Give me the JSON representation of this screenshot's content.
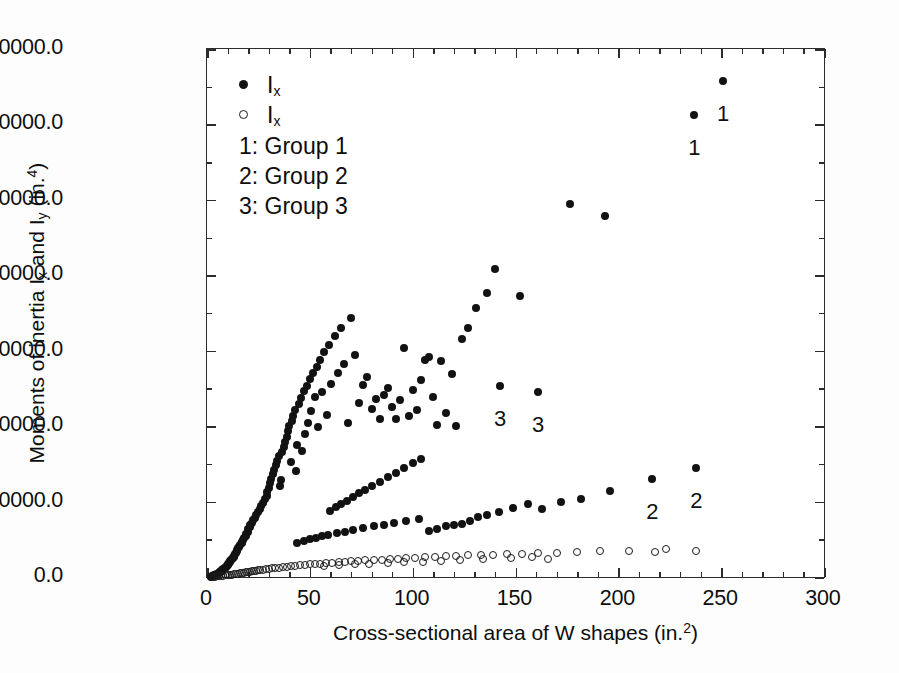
{
  "figure": {
    "background": "#ffffff",
    "foreground": "#121212"
  },
  "axes": {
    "y_title_prefix": "Moments of inertia I",
    "y_title_sub1": "x",
    "y_title_mid": " and I",
    "y_title_sub2": "y",
    "y_title_suffix": " (in.",
    "y_title_sup": "4",
    "y_title_close": ")",
    "x_title_prefix": "Cross-sectional area of W shapes (in.",
    "x_title_sup": "2",
    "x_title_close": ")"
  },
  "legend": {
    "entries": [
      {
        "marker": "filled-circle",
        "symbol": "I",
        "subscript": "x"
      },
      {
        "marker": "open-circle",
        "symbol": "I",
        "subscript": "x"
      }
    ],
    "groups": [
      "1: Group 1",
      "2: Group 2",
      "3: Group 3"
    ]
  },
  "chart_data": {
    "type": "scatter",
    "title": "",
    "xlabel": "Cross-sectional area of W shapes (in.^2)",
    "ylabel": "Moments of inertia I_x and I_y (in.^4)",
    "xlim": [
      0,
      300
    ],
    "ylim": [
      0,
      70000
    ],
    "xticks": [
      0,
      50,
      100,
      150,
      200,
      250,
      300
    ],
    "xticklabels": [
      "0",
      "50",
      "100",
      "150",
      "200",
      "250",
      "300"
    ],
    "yticks": [
      0,
      10000,
      20000,
      30000,
      40000,
      50000,
      60000,
      70000
    ],
    "yticklabels": [
      "0.0",
      "10000.0",
      "20000.0",
      "30000.0",
      "40000.0",
      "50000.0",
      "60000.0",
      "70000.0"
    ],
    "xminor_step": 10,
    "yminor_step": 5000,
    "grid": false,
    "legend_position": "upper-left-inside-margin",
    "series": [
      {
        "name": "I_x",
        "marker": "filled-circle",
        "points": [
          [
            1.8,
            60
          ],
          [
            2.2,
            90
          ],
          [
            2.7,
            130
          ],
          [
            3.0,
            170
          ],
          [
            3.5,
            210
          ],
          [
            4.0,
            260
          ],
          [
            4.4,
            310
          ],
          [
            4.7,
            350
          ],
          [
            5.0,
            400
          ],
          [
            5.3,
            450
          ],
          [
            5.6,
            500
          ],
          [
            5.9,
            560
          ],
          [
            6.2,
            620
          ],
          [
            6.5,
            680
          ],
          [
            6.8,
            740
          ],
          [
            7.1,
            800
          ],
          [
            7.4,
            880
          ],
          [
            7.7,
            950
          ],
          [
            8.0,
            1020
          ],
          [
            8.5,
            1100
          ],
          [
            8.8,
            1200
          ],
          [
            9.1,
            1290
          ],
          [
            9.4,
            1380
          ],
          [
            9.7,
            1480
          ],
          [
            10.0,
            1600
          ],
          [
            10.3,
            1700
          ],
          [
            10.6,
            1830
          ],
          [
            11.0,
            1950
          ],
          [
            11.3,
            2070
          ],
          [
            11.8,
            2200
          ],
          [
            12.2,
            2370
          ],
          [
            12.6,
            2540
          ],
          [
            13.0,
            2700
          ],
          [
            13.3,
            2850
          ],
          [
            13.8,
            3000
          ],
          [
            14.1,
            3200
          ],
          [
            14.4,
            3400
          ],
          [
            14.7,
            3620
          ],
          [
            15.0,
            3800
          ],
          [
            15.6,
            4020
          ],
          [
            16.2,
            4280
          ],
          [
            16.8,
            4500
          ],
          [
            17.1,
            4700
          ],
          [
            17.6,
            4930
          ],
          [
            18.2,
            5200
          ],
          [
            18.8,
            5450
          ],
          [
            19.1,
            5700
          ],
          [
            19.7,
            6000
          ],
          [
            20.0,
            6300
          ],
          [
            20.8,
            6600
          ],
          [
            21.1,
            6900
          ],
          [
            21.8,
            7200
          ],
          [
            22.4,
            7500
          ],
          [
            23.2,
            7800
          ],
          [
            24.0,
            8200
          ],
          [
            24.7,
            8600
          ],
          [
            25.6,
            9000
          ],
          [
            26.2,
            9400
          ],
          [
            27.3,
            9800
          ],
          [
            28.2,
            10300
          ],
          [
            29.1,
            10800
          ],
          [
            29.4,
            11300
          ],
          [
            30.0,
            11800
          ],
          [
            30.6,
            12400
          ],
          [
            31.2,
            13000
          ],
          [
            32.0,
            13600
          ],
          [
            32.7,
            14200
          ],
          [
            33.5,
            14800
          ],
          [
            34.2,
            15400
          ],
          [
            35.0,
            16000
          ],
          [
            35.3,
            12100
          ],
          [
            36.0,
            12800
          ],
          [
            36.5,
            16600
          ],
          [
            37.2,
            17300
          ],
          [
            38.0,
            17900
          ],
          [
            38.8,
            18600
          ],
          [
            39.4,
            19300
          ],
          [
            40.0,
            20000
          ],
          [
            40.6,
            15200
          ],
          [
            41.2,
            20700
          ],
          [
            42.0,
            21400
          ],
          [
            42.7,
            22100
          ],
          [
            43.4,
            14000
          ],
          [
            44.0,
            17500
          ],
          [
            44.8,
            23000
          ],
          [
            45.5,
            23700
          ],
          [
            46.2,
            16700
          ],
          [
            47.0,
            24600
          ],
          [
            47.8,
            18900
          ],
          [
            48.5,
            25300
          ],
          [
            49.2,
            20400
          ],
          [
            50.0,
            26200
          ],
          [
            50.7,
            22000
          ],
          [
            51.5,
            27000
          ],
          [
            52.4,
            23800
          ],
          [
            53.3,
            27900
          ],
          [
            54.2,
            19900
          ],
          [
            55.0,
            28800
          ],
          [
            56.0,
            24500
          ],
          [
            57.0,
            29800
          ],
          [
            58.2,
            21500
          ],
          [
            59.4,
            30800
          ],
          [
            60.5,
            25600
          ],
          [
            62.0,
            31900
          ],
          [
            63.5,
            27000
          ],
          [
            65.0,
            33000
          ],
          [
            66.8,
            28200
          ],
          [
            68.5,
            20400
          ],
          [
            70.0,
            34300
          ],
          [
            72.0,
            29400
          ],
          [
            74.0,
            23100
          ],
          [
            76.0,
            25400
          ],
          [
            78.0,
            26500
          ],
          [
            80.0,
            22300
          ],
          [
            82.0,
            23600
          ],
          [
            84.0,
            21000
          ],
          [
            86.0,
            24100
          ],
          [
            88.0,
            25100
          ],
          [
            90.0,
            22600
          ],
          [
            92.0,
            20900
          ],
          [
            94.0,
            23400
          ],
          [
            96.0,
            30400
          ],
          [
            98.0,
            21400
          ],
          [
            100.0,
            24800
          ],
          [
            102.0,
            22200
          ],
          [
            104.0,
            26100
          ],
          [
            106.0,
            28800
          ],
          [
            108.0,
            29200
          ],
          [
            110.0,
            23900
          ],
          [
            112.0,
            20100
          ],
          [
            114.0,
            28600
          ],
          [
            116.0,
            21700
          ],
          [
            119.0,
            26900
          ],
          [
            121.0,
            20000
          ],
          [
            124.0,
            31500
          ],
          [
            127.0,
            33000
          ],
          [
            131.0,
            35600
          ],
          [
            136.0,
            37600
          ],
          [
            140.0,
            40800
          ],
          [
            152.0,
            37300
          ],
          [
            176.5,
            49400
          ],
          [
            193.5,
            47900
          ],
          [
            237.0,
            61200
          ],
          [
            251.0,
            65700
          ],
          [
            142.5,
            25300
          ],
          [
            161.0,
            24500
          ],
          [
            216.5,
            13000
          ],
          [
            238.0,
            14500
          ],
          [
            60.0,
            8800
          ],
          [
            62.5,
            9300
          ],
          [
            65.0,
            9700
          ],
          [
            68.0,
            10100
          ],
          [
            71.0,
            10600
          ],
          [
            74.0,
            11100
          ],
          [
            77.0,
            11600
          ],
          [
            80.0,
            12100
          ],
          [
            84.0,
            12600
          ],
          [
            88.0,
            13200
          ],
          [
            92.0,
            13800
          ],
          [
            96.0,
            14400
          ],
          [
            100.0,
            15100
          ],
          [
            104.0,
            15700
          ],
          [
            108.0,
            6100
          ],
          [
            112.0,
            6400
          ],
          [
            116.0,
            6700
          ],
          [
            120.0,
            6900
          ],
          [
            124.0,
            7000
          ],
          [
            128.0,
            7400
          ],
          [
            132.0,
            7900
          ],
          [
            136.0,
            8200
          ],
          [
            142.0,
            8600
          ],
          [
            149.0,
            9200
          ],
          [
            156.0,
            9700
          ],
          [
            163.0,
            9000
          ],
          [
            172.0,
            9900
          ],
          [
            182.0,
            10400
          ],
          [
            196.0,
            11400
          ],
          [
            44.0,
            4500
          ],
          [
            47.0,
            4800
          ],
          [
            50.0,
            5000
          ],
          [
            53.0,
            5200
          ],
          [
            56.0,
            5400
          ],
          [
            59.0,
            5600
          ],
          [
            63.0,
            5800
          ],
          [
            67.0,
            6000
          ],
          [
            71.0,
            6200
          ],
          [
            76.0,
            6500
          ],
          [
            81.0,
            6700
          ],
          [
            86.0,
            6900
          ],
          [
            91.0,
            7100
          ],
          [
            97.0,
            7400
          ],
          [
            103.0,
            7700
          ]
        ]
      },
      {
        "name": "I_y",
        "marker": "open-circle",
        "points": [
          [
            2.0,
            20
          ],
          [
            3.0,
            40
          ],
          [
            4.0,
            60
          ],
          [
            5.0,
            80
          ],
          [
            6.0,
            110
          ],
          [
            7.0,
            140
          ],
          [
            8.0,
            170
          ],
          [
            9.0,
            200
          ],
          [
            10.0,
            240
          ],
          [
            11.0,
            280
          ],
          [
            12.0,
            320
          ],
          [
            13.0,
            360
          ],
          [
            14.0,
            400
          ],
          [
            15.0,
            440
          ],
          [
            16.0,
            480
          ],
          [
            17.0,
            520
          ],
          [
            18.0,
            560
          ],
          [
            19.0,
            600
          ],
          [
            20.0,
            640
          ],
          [
            21.0,
            690
          ],
          [
            22.0,
            740
          ],
          [
            23.0,
            780
          ],
          [
            24.0,
            830
          ],
          [
            25.0,
            880
          ],
          [
            26.0,
            930
          ],
          [
            27.0,
            980
          ],
          [
            28.5,
            1030
          ],
          [
            30.0,
            1080
          ],
          [
            31.5,
            1130
          ],
          [
            33.0,
            1180
          ],
          [
            35.0,
            1240
          ],
          [
            37.0,
            1300
          ],
          [
            39.0,
            1360
          ],
          [
            41.0,
            1420
          ],
          [
            43.0,
            1480
          ],
          [
            45.0,
            1540
          ],
          [
            47.5,
            1600
          ],
          [
            50.0,
            1660
          ],
          [
            52.5,
            1720
          ],
          [
            55.0,
            1780
          ],
          [
            58.0,
            1840
          ],
          [
            61.0,
            1900
          ],
          [
            64.0,
            1960
          ],
          [
            67.0,
            2020
          ],
          [
            70.0,
            2080
          ],
          [
            73.5,
            2140
          ],
          [
            77.0,
            2200
          ],
          [
            81.0,
            2260
          ],
          [
            85.0,
            2320
          ],
          [
            89.0,
            2380
          ],
          [
            93.0,
            2440
          ],
          [
            97.0,
            2500
          ],
          [
            101.0,
            2560
          ],
          [
            106.0,
            2620
          ],
          [
            111.0,
            2680
          ],
          [
            116.0,
            2740
          ],
          [
            121.0,
            2800
          ],
          [
            127.0,
            2860
          ],
          [
            133.0,
            2920
          ],
          [
            139.0,
            2980
          ],
          [
            146.0,
            3040
          ],
          [
            153.0,
            3100
          ],
          [
            161.0,
            3160
          ],
          [
            170.0,
            3220
          ],
          [
            180.0,
            3300
          ],
          [
            191.0,
            3400
          ],
          [
            205.0,
            3500
          ],
          [
            218.0,
            3300
          ],
          [
            223.0,
            3700
          ],
          [
            238.0,
            3400
          ],
          [
            57.0,
            1500
          ],
          [
            64.0,
            1620
          ],
          [
            72.0,
            1700
          ],
          [
            79.0,
            1780
          ],
          [
            88.0,
            1870
          ],
          [
            96.0,
            1950
          ],
          [
            105.0,
            2050
          ],
          [
            114.0,
            2150
          ],
          [
            123.0,
            2250
          ],
          [
            134.0,
            2350
          ],
          [
            148.0,
            2480
          ],
          [
            158.0,
            2600
          ],
          [
            166.0,
            2400
          ]
        ]
      }
    ],
    "annotations": [
      {
        "text": "1",
        "x": 237.0,
        "y": 61200,
        "dy_px": 22
      },
      {
        "text": "1",
        "x": 251.0,
        "y": 65700,
        "dy_px": 22
      },
      {
        "text": "3",
        "x": 142.5,
        "y": 25300,
        "dy_px": 22
      },
      {
        "text": "3",
        "x": 161.0,
        "y": 24500,
        "dy_px": 22
      },
      {
        "text": "2",
        "x": 216.5,
        "y": 13000,
        "dy_px": 22
      },
      {
        "text": "2",
        "x": 238.0,
        "y": 14500,
        "dy_px": 22
      }
    ]
  }
}
